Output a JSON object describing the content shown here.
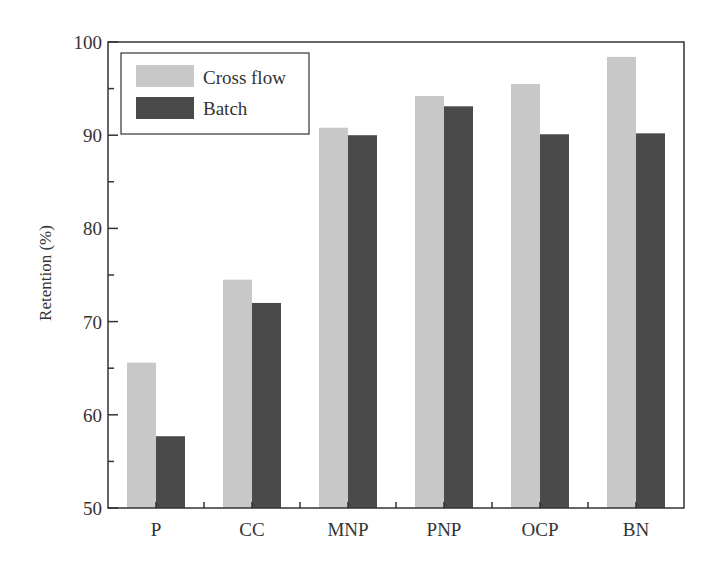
{
  "chart_data": {
    "type": "bar",
    "title": "",
    "xlabel": "",
    "ylabel": "Retention (%)",
    "ylim": [
      50,
      100
    ],
    "yticks": [
      50,
      60,
      70,
      80,
      90,
      100
    ],
    "grid": false,
    "legend_position": "upper left",
    "categories": [
      "P",
      "CC",
      "MNP",
      "PNP",
      "OCP",
      "BN"
    ],
    "series": [
      {
        "name": "Cross flow",
        "color": "#c8c8c8",
        "values": [
          65.6,
          74.5,
          90.8,
          94.2,
          95.5,
          98.4
        ]
      },
      {
        "name": "Batch",
        "color": "#4a4a4a",
        "values": [
          57.7,
          72.0,
          90.0,
          93.1,
          90.1,
          90.2
        ]
      }
    ]
  }
}
